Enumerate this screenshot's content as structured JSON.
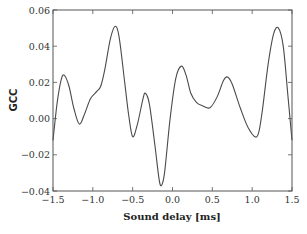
{
  "chart_data": {
    "type": "line",
    "title": "",
    "xlabel": "Sound delay [ms]",
    "ylabel": "GCC",
    "xlim": [
      -1.5,
      1.5
    ],
    "ylim": [
      -0.04,
      0.06
    ],
    "grid": false,
    "legend": null,
    "xticks": [
      -1.5,
      -1.0,
      -0.5,
      0.0,
      0.5,
      1.0,
      1.5
    ],
    "xtick_labels": [
      "−1.5",
      "−1.0",
      "−0.5",
      "0.0",
      "0.5",
      "1.0",
      "1.5"
    ],
    "yticks": [
      -0.04,
      -0.02,
      0.0,
      0.02,
      0.04,
      0.06
    ],
    "ytick_labels": [
      "−0.04",
      "−0.02",
      "0.00",
      "0.02",
      "0.04",
      "0.06"
    ],
    "series": [
      {
        "name": "GCC",
        "color": "#4a4a4a",
        "x": [
          -1.5,
          -1.45,
          -1.4,
          -1.36,
          -1.3,
          -1.24,
          -1.17,
          -1.1,
          -1.03,
          -0.95,
          -0.9,
          -0.85,
          -0.78,
          -0.72,
          -0.67,
          -0.6,
          -0.55,
          -0.5,
          -0.44,
          -0.37,
          -0.34,
          -0.29,
          -0.22,
          -0.17,
          -0.14,
          -0.1,
          -0.03,
          0.04,
          0.11,
          0.17,
          0.23,
          0.3,
          0.38,
          0.47,
          0.56,
          0.64,
          0.69,
          0.75,
          0.85,
          0.95,
          1.06,
          1.12,
          1.2,
          1.27,
          1.33,
          1.39,
          1.45,
          1.5
        ],
        "y": [
          -0.012,
          0.008,
          0.021,
          0.024,
          0.018,
          0.006,
          -0.003,
          0.003,
          0.011,
          0.015,
          0.018,
          0.027,
          0.044,
          0.051,
          0.045,
          0.02,
          0.002,
          -0.01,
          -0.003,
          0.011,
          0.014,
          0.008,
          -0.015,
          -0.033,
          -0.037,
          -0.03,
          0.0,
          0.022,
          0.029,
          0.024,
          0.014,
          0.009,
          0.007,
          0.006,
          0.012,
          0.021,
          0.023,
          0.019,
          0.006,
          -0.005,
          -0.01,
          0.002,
          0.03,
          0.047,
          0.05,
          0.04,
          0.012,
          -0.012
        ]
      }
    ]
  },
  "plot_area": {
    "left": 53,
    "top": 10,
    "right": 292,
    "bottom": 191
  }
}
